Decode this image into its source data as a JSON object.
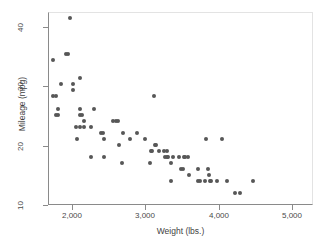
{
  "chart_data": {
    "type": "scatter",
    "title": "",
    "xlabel": "Weight (lbs.)",
    "ylabel": "Mileage (mpg)",
    "xlim": [
      1700,
      5050
    ],
    "ylim": [
      10,
      42
    ],
    "xticks": [
      2000,
      3000,
      4000,
      5000
    ],
    "xtick_labels": [
      "2,000",
      "3,000",
      "4,000",
      "5,000"
    ],
    "yticks": [
      10,
      20,
      30,
      40
    ],
    "ytick_labels": [
      "10",
      "20",
      "30",
      "40"
    ],
    "grid": false,
    "legend": "none",
    "marker": {
      "shape": "circle",
      "color": "#575757",
      "size_px": 4
    },
    "series": [
      {
        "name": "Mileage vs Weight",
        "points": [
          [
            1760,
            28
          ],
          [
            1800,
            28
          ],
          [
            1760,
            34
          ],
          [
            1830,
            26
          ],
          [
            1800,
            25
          ],
          [
            1830,
            25
          ],
          [
            1870,
            30
          ],
          [
            1930,
            35
          ],
          [
            1950,
            35
          ],
          [
            1980,
            41
          ],
          [
            2020,
            30
          ],
          [
            2020,
            29
          ],
          [
            2050,
            23
          ],
          [
            2070,
            21
          ],
          [
            2110,
            31
          ],
          [
            2110,
            25
          ],
          [
            2110,
            26
          ],
          [
            2130,
            25
          ],
          [
            2160,
            24
          ],
          [
            2110,
            23
          ],
          [
            2160,
            23
          ],
          [
            2240,
            18
          ],
          [
            2240,
            23
          ],
          [
            2280,
            26
          ],
          [
            2370,
            22
          ],
          [
            2400,
            22
          ],
          [
            2410,
            21
          ],
          [
            2410,
            18
          ],
          [
            2520,
            24
          ],
          [
            2560,
            24
          ],
          [
            2580,
            24
          ],
          [
            2600,
            20
          ],
          [
            2640,
            17
          ],
          [
            2650,
            22
          ],
          [
            2730,
            21
          ],
          [
            2830,
            22
          ],
          [
            2930,
            21
          ],
          [
            2990,
            17
          ],
          [
            3000,
            19
          ],
          [
            3020,
            19
          ],
          [
            3040,
            28
          ],
          [
            3050,
            20
          ],
          [
            3060,
            20
          ],
          [
            3100,
            19
          ],
          [
            3170,
            19
          ],
          [
            3180,
            18
          ],
          [
            3200,
            18
          ],
          [
            3210,
            19
          ],
          [
            3220,
            18
          ],
          [
            3250,
            17
          ],
          [
            3260,
            14
          ],
          [
            3280,
            18
          ],
          [
            3350,
            18
          ],
          [
            3380,
            16
          ],
          [
            3400,
            16
          ],
          [
            3420,
            18
          ],
          [
            3430,
            18
          ],
          [
            3470,
            18
          ],
          [
            3480,
            15
          ],
          [
            3600,
            16
          ],
          [
            3600,
            14
          ],
          [
            3620,
            14
          ],
          [
            3690,
            14
          ],
          [
            3700,
            21
          ],
          [
            3720,
            16
          ],
          [
            3740,
            15
          ],
          [
            3750,
            14
          ],
          [
            3760,
            14
          ],
          [
            3830,
            14
          ],
          [
            3900,
            21
          ],
          [
            3960,
            14
          ],
          [
            4060,
            12
          ],
          [
            4130,
            12
          ],
          [
            4290,
            14
          ]
        ]
      }
    ]
  },
  "axes": {
    "xlabel": "Weight (lbs.)",
    "ylabel": "Mileage (mpg)",
    "xtick_labels": [
      "2,000",
      "3,000",
      "4,000",
      "5,000"
    ],
    "ytick_labels": [
      "10",
      "20",
      "30",
      "40"
    ]
  }
}
